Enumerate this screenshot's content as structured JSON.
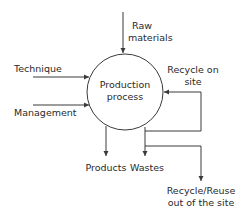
{
  "diagram": {
    "type": "process-flow",
    "center_node": {
      "label_line1": "Production",
      "label_line2": "process"
    },
    "inputs": [
      {
        "label": "Raw materials",
        "line1": "Raw",
        "line2": "materials",
        "direction": "from-top"
      },
      {
        "label": "Technique",
        "direction": "from-left"
      },
      {
        "label": "Management",
        "direction": "from-left"
      },
      {
        "label": "Recycle on site",
        "line1": "Recycle on",
        "line2": "site",
        "direction": "from-right-loop"
      }
    ],
    "outputs": [
      {
        "label": "Products",
        "direction": "down"
      },
      {
        "label": "Wastes",
        "direction": "down"
      },
      {
        "label": "Recycle/Reuse out of the site",
        "line1": "Recycle/Reuse",
        "line2": "out of the site",
        "direction": "down-branch"
      }
    ],
    "colors": {
      "line": "#3a3a3a",
      "text": "#2a2a2a",
      "background": "#ffffff"
    }
  }
}
